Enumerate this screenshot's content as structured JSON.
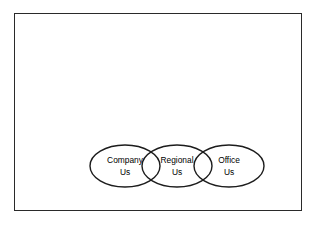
{
  "figure": {
    "background_color": "#ffffff",
    "frame": {
      "border_color": "#2a2a2a",
      "fill_color": "#ffffff"
    },
    "diagram_type": "overlapping-ellipse-chain",
    "stroke_color": "#1c1c1c",
    "text_color": "#000000",
    "nodes": [
      {
        "id": "company",
        "line1": "Company",
        "line2": "Us",
        "cx": 36,
        "cy": 26,
        "rx": 35,
        "ry": 21
      },
      {
        "id": "regional",
        "line1": "Regional",
        "line2": "Us",
        "cx": 88,
        "cy": 26,
        "rx": 35,
        "ry": 21
      },
      {
        "id": "office",
        "line1": "Office",
        "line2": "Us",
        "cx": 140,
        "cy": 26,
        "rx": 35,
        "ry": 21
      }
    ]
  }
}
